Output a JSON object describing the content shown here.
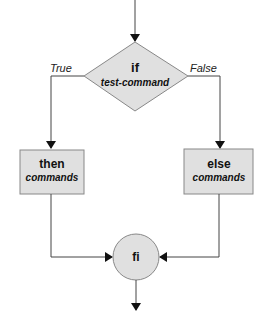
{
  "diagram": {
    "type": "flowchart",
    "colors": {
      "fill": "#e0e0e0",
      "stroke": "#666666",
      "line": "#444444"
    },
    "decision": {
      "keyword": "if",
      "text": "test-command"
    },
    "branches": {
      "true_label": "True",
      "false_label": "False"
    },
    "then_box": {
      "keyword": "then",
      "text": "commands"
    },
    "else_box": {
      "keyword": "else",
      "text": "commands"
    },
    "end_node": {
      "keyword": "fi"
    }
  }
}
